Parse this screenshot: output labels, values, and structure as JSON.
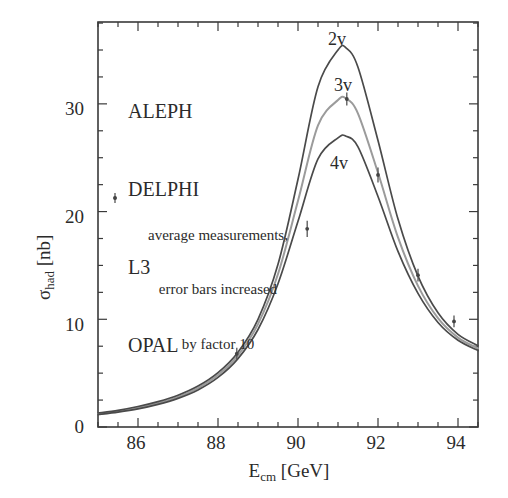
{
  "figure": {
    "background": "#ffffff",
    "frame_color": "#3a3a3a"
  },
  "experiments": {
    "items": [
      {
        "label": "ALEPH"
      },
      {
        "label": "DELPHI"
      },
      {
        "label": "L3"
      },
      {
        "label": "OPAL"
      }
    ]
  },
  "legend": {
    "marker": "♁",
    "line1": "average measurements,",
    "line2": "error bars increased",
    "line3": "by factor 10"
  },
  "curve_labels": {
    "two_nu": "2v",
    "three_nu": "3v",
    "four_nu": "4v"
  },
  "axes": {
    "x_title_main": "E",
    "x_title_sub": "cm",
    "x_title_unit": " [GeV]",
    "y_title_main": "σ",
    "y_title_sub": "had",
    "y_title_unit": " [nb]"
  },
  "chart_data": {
    "type": "line",
    "title": "",
    "subtitle": "",
    "xlabel": "E_cm [GeV]",
    "ylabel": "sigma_had [nb]",
    "xlim": [
      85.0,
      94.5
    ],
    "ylim": [
      0,
      37.6
    ],
    "grid": false,
    "legend_position": "inside-plot-annotations",
    "x_ticks_major": [
      86,
      88,
      90,
      92,
      94
    ],
    "x_tick_labels": [
      "86",
      "88",
      "90",
      "92",
      "94"
    ],
    "x_tick_minor_step": 0.5,
    "y_ticks_major": [
      0,
      10,
      20,
      30
    ],
    "y_tick_labels": [
      "0",
      "10",
      "20",
      "30"
    ],
    "y_tick_minor_step": 2.5,
    "resonance": {
      "peak_energy_gev": 91.2,
      "width_gev": 2.5
    },
    "series": [
      {
        "name": "2v",
        "description": "Standard Model prediction for 2 neutrino generations",
        "color": "#4a4a4a",
        "peak_value": 35.2,
        "x": [
          85.0,
          85.5,
          86.0,
          86.5,
          87.0,
          87.5,
          88.0,
          88.5,
          89.0,
          89.5,
          90.0,
          90.5,
          91.0,
          91.2,
          91.5,
          92.0,
          92.5,
          93.0,
          93.5,
          94.0,
          94.5
        ],
        "values": [
          1.3,
          1.55,
          1.9,
          2.35,
          2.95,
          3.8,
          5.05,
          6.95,
          10.0,
          15.1,
          23.0,
          31.6,
          35.0,
          35.2,
          33.4,
          26.6,
          19.3,
          14.0,
          10.6,
          8.6,
          7.55
        ]
      },
      {
        "name": "3v",
        "description": "Standard Model prediction for 3 neutrino generations",
        "color": "#9b9b9b",
        "peak_value": 30.5,
        "x": [
          85.0,
          85.5,
          86.0,
          86.5,
          87.0,
          87.5,
          88.0,
          88.5,
          89.0,
          89.5,
          90.0,
          90.5,
          91.0,
          91.2,
          91.5,
          92.0,
          92.5,
          93.0,
          93.5,
          94.0,
          94.5
        ],
        "values": [
          1.22,
          1.45,
          1.78,
          2.22,
          2.8,
          3.62,
          4.82,
          6.65,
          9.55,
          14.2,
          21.0,
          28.0,
          30.35,
          30.5,
          29.1,
          23.6,
          17.6,
          13.1,
          10.1,
          8.3,
          7.3
        ]
      },
      {
        "name": "4v",
        "description": "Standard Model prediction for 4 neutrino generations",
        "color": "#4a4a4a",
        "peak_value": 27.0,
        "x": [
          85.0,
          85.5,
          86.0,
          86.5,
          87.0,
          87.5,
          88.0,
          88.5,
          89.0,
          89.5,
          90.0,
          90.5,
          91.0,
          91.2,
          91.5,
          92.0,
          92.5,
          93.0,
          93.5,
          94.0,
          94.5
        ],
        "values": [
          1.15,
          1.38,
          1.68,
          2.1,
          2.66,
          3.44,
          4.6,
          6.35,
          9.05,
          13.3,
          19.1,
          24.9,
          26.85,
          27.0,
          26.0,
          21.4,
          16.3,
          12.4,
          9.7,
          8.05,
          7.1
        ]
      }
    ],
    "measurements": {
      "name": "average measurements",
      "marker": "point-with-vertical-errorbar",
      "error_bars_scale_factor": 10,
      "points": [
        {
          "x": 88.47,
          "y": 6.8,
          "yerr": 0.55
        },
        {
          "x": 90.23,
          "y": 18.4,
          "yerr": 0.75
        },
        {
          "x": 91.22,
          "y": 30.45,
          "yerr": 0.6
        },
        {
          "x": 92.0,
          "y": 23.4,
          "yerr": 0.7
        },
        {
          "x": 93.0,
          "y": 14.1,
          "yerr": 0.6
        },
        {
          "x": 93.9,
          "y": 9.8,
          "yerr": 0.55
        }
      ]
    }
  }
}
